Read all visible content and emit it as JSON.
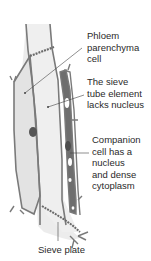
{
  "diagram": {
    "labels": [
      {
        "id": "phloem-parenchyma",
        "text": "Phloem\nparenchyma\ncell"
      },
      {
        "id": "sieve-tube-element",
        "text": "The sieve\ntube element\nlacks nucleus"
      },
      {
        "id": "companion-cell",
        "text": "Companion\ncell has a\nnucleus\nand dense\ncytoplasm"
      },
      {
        "id": "sieve-plate",
        "text": "Sieve plate"
      }
    ],
    "colors": {
      "cell_wall": "#7a7a7a",
      "parenchyma_fill": "#e6e6e6",
      "sieve_tube_fill": "#ececec",
      "companion_fill": "#6e6e6e",
      "nucleus": "#555555",
      "leader_line": "#444444",
      "text": "#2a2a2a"
    }
  }
}
